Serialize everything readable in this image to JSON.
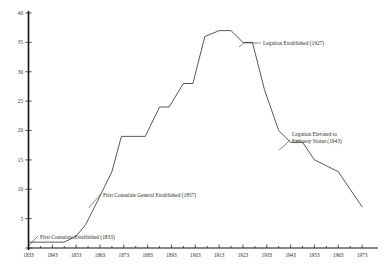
{
  "chart_data": {
    "type": "line",
    "title": "",
    "subtitle": "",
    "xlabel": "",
    "ylabel": "",
    "xlim": [
      1833,
      1978
    ],
    "ylim": [
      0,
      40
    ],
    "grid": false,
    "legend": "none",
    "y_ticks": [
      0,
      5,
      10,
      15,
      20,
      25,
      30,
      35,
      40
    ],
    "y_tick_labels": [
      "",
      "5",
      "10",
      "15",
      "20",
      "25",
      "30",
      "35",
      "40"
    ],
    "x_ticks": [
      1833,
      1843,
      1853,
      1863,
      1873,
      1883,
      1893,
      1903,
      1913,
      1923,
      1933,
      1943,
      1953,
      1963,
      1973
    ],
    "x_tick_labels": [
      "1833",
      "1843",
      "1853",
      "1863",
      "1873",
      "1883",
      "1893",
      "1903",
      "1913",
      "1923",
      "1933",
      "1943",
      "1953",
      "1963",
      "1973"
    ],
    "x_minor_ticks": [
      1838,
      1848,
      1858,
      1868,
      1878,
      1888,
      1898,
      1908,
      1918,
      1928,
      1938,
      1948,
      1958,
      1968
    ],
    "series": [
      {
        "name": "Posts",
        "x": [
          1833,
          1848,
          1853,
          1857,
          1862,
          1868,
          1872,
          1877,
          1882,
          1888,
          1892,
          1898,
          1902,
          1907,
          1913,
          1918,
          1923,
          1927,
          1932,
          1938,
          1943,
          1948,
          1953,
          1958,
          1963,
          1968,
          1973
        ],
        "values": [
          1,
          1,
          2,
          4,
          8,
          13,
          19,
          19,
          19,
          24,
          24,
          28,
          28,
          36,
          37,
          37,
          35,
          35,
          27,
          20,
          18,
          18,
          15,
          14,
          13,
          10,
          7
        ]
      }
    ],
    "annotations": [
      {
        "id": "first-consulate",
        "lines": [
          "First Consulate Established (1833)"
        ],
        "year": 1833,
        "value": 1
      },
      {
        "id": "first-consulate-general",
        "lines": [
          "First Consulate General Established (1857)"
        ],
        "year": 1857,
        "value": 4
      },
      {
        "id": "legation-established",
        "lines": [
          "Legation Established (1927)"
        ],
        "year": 1927,
        "value": 35
      },
      {
        "id": "legation-elevated",
        "lines": [
          "Legation Elevated to",
          "Embassy Status (1943)"
        ],
        "year": 1943,
        "value": 18
      }
    ],
    "colors": {
      "line": "#3a3a3a",
      "axis": "#111111",
      "text": "#2b2b2b",
      "background": "#ffffff"
    }
  }
}
